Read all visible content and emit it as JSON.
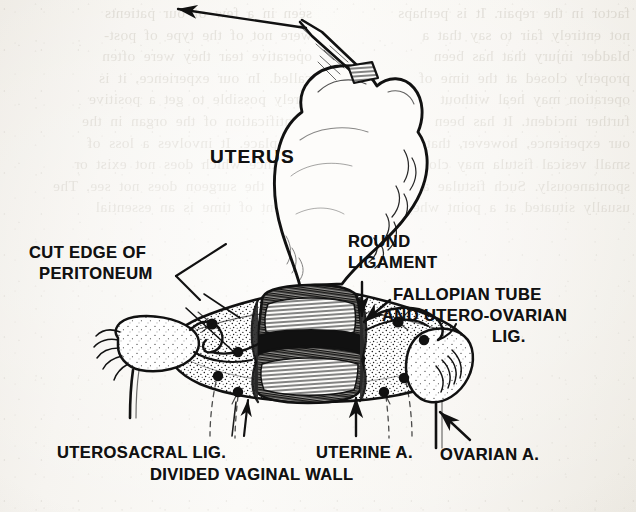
{
  "figure": {
    "medium": "black-and-white line illustration on aged book paper",
    "ink_color": "#111111",
    "paper_color": "#f5f3ef",
    "bleed_color": "#8d8472"
  },
  "labels": [
    {
      "id": "uterus",
      "text": "UTERUS",
      "x": 210,
      "y": 147,
      "size": 19
    },
    {
      "id": "cut-edge-line1",
      "text": "CUT EDGE OF",
      "x": 29,
      "y": 244,
      "size": 16.5
    },
    {
      "id": "cut-edge-line2",
      "text": "PERITONEUM",
      "x": 39,
      "y": 265,
      "size": 16.5
    },
    {
      "id": "round-lig-line1",
      "text": "ROUND",
      "x": 348,
      "y": 233,
      "size": 16.5
    },
    {
      "id": "round-lig-line2",
      "text": "LIGAMENT",
      "x": 348,
      "y": 254,
      "size": 16.5
    },
    {
      "id": "fallopian-line1",
      "text": "FALLOPIAN TUBE",
      "x": 393,
      "y": 286,
      "size": 16.5
    },
    {
      "id": "fallopian-line2",
      "text": "AND UTERO-OVARIAN",
      "x": 382,
      "y": 307,
      "size": 16.5
    },
    {
      "id": "fallopian-line3",
      "text": "LIG.",
      "x": 492,
      "y": 328,
      "size": 16.5
    },
    {
      "id": "uterosacral",
      "text": "UTEROSACRAL  LIG.",
      "x": 57,
      "y": 444,
      "size": 16.5
    },
    {
      "id": "uterine-artery",
      "text": "UTERINE A.",
      "x": 316,
      "y": 444,
      "size": 16.5
    },
    {
      "id": "ovarian-artery",
      "text": "OVARIAN A.",
      "x": 440,
      "y": 446,
      "size": 16.5
    },
    {
      "id": "divided-vaginal",
      "text": "DIVIDED VAGINAL WALL",
      "x": 150,
      "y": 466,
      "size": 16.5
    }
  ],
  "anatomy": {
    "structures": [
      "uterus",
      "cut edge of peritoneum",
      "round ligament",
      "fallopian tube and utero-ovarian ligament",
      "uterosacral ligament",
      "uterine artery",
      "ovarian artery",
      "divided vaginal wall",
      "left ovary",
      "right ovary",
      "tenaculum clamp on fundus"
    ]
  },
  "pointers": {
    "traction_arrow": "upward-left traction on uterine fundus",
    "round_ligament_arrow": "downward",
    "fallopian_arrow": "down-left",
    "uterosacral_arrow": "upward",
    "uterine_artery_arrow": "upward",
    "ovarian_artery_arrow": "up-right",
    "cut_edge_leader": "diagonal leader line up-right to peritoneal edge"
  },
  "bleed_text": {
    "left": "seen in a few of our patients\nwere not of the type of post-\noperative tear they were often\ncalled. In our experience, it is\nrarely possible to get a positive\nidentification of the organ in the\nfirst place. It involves a loss of\nsubstance which does not exist or\nwhich the surgeon does not see. The\nelement of time is an essential",
    "right": "factor in the repair. It is perhaps\nnot entirely fair to say that a\nbladder injury that has been\nproperly closed at the time of\noperation may heal without\nfurther incident. It has been\nour experience, however, that a\nsmall vesical fistula may close\nspontaneously. Such fistulae are\nusually situated at a point where"
  }
}
